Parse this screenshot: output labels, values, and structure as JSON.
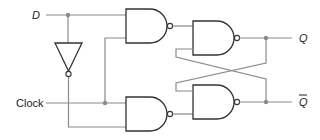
{
  "diagram": {
    "labels": {
      "d_input": "D",
      "clock_input": "Clock",
      "q_output": "Q",
      "qbar_output": "Q"
    },
    "components": [
      {
        "id": "inverter",
        "type": "NOT"
      },
      {
        "id": "nand-top-left",
        "type": "NAND"
      },
      {
        "id": "nand-bottom-left",
        "type": "NAND"
      },
      {
        "id": "nand-top-right",
        "type": "NAND"
      },
      {
        "id": "nand-bottom-right",
        "type": "NAND"
      }
    ],
    "colors": {
      "wire": "#8a8a8a",
      "gate_outline": "#333333",
      "background": "#ffffff"
    }
  }
}
